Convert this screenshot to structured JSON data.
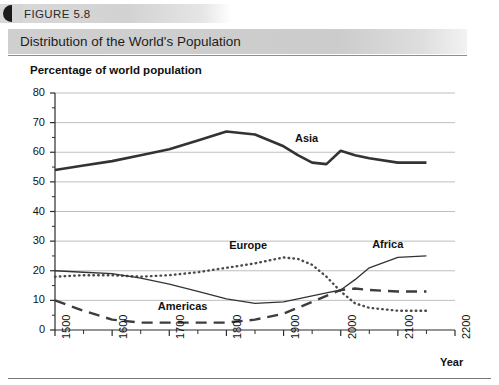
{
  "header": {
    "figure_number": "FIGURE 5.8",
    "badge_icon": "filled-circle-icon",
    "title": "Distribution of the World's Population"
  },
  "axis_title_label": "Year",
  "chart_data": {
    "type": "line",
    "title": "Distribution of the World's Population",
    "xlabel": "Year",
    "ylabel": "Percentage of world population",
    "y_axis_title_text": "Percentage of world population",
    "grid": true,
    "legend_position": "inline-annotations",
    "xlim": [
      1500,
      2200
    ],
    "ylim": [
      0,
      80
    ],
    "yticks": [
      0,
      10,
      20,
      30,
      40,
      50,
      60,
      70,
      80
    ],
    "ytick_labels": [
      "0",
      "10",
      "20",
      "30",
      "40",
      "50",
      "60",
      "70",
      "80"
    ],
    "xticks": [
      1500,
      1600,
      1700,
      1800,
      1900,
      2000,
      2100,
      2200
    ],
    "xtick_labels": [
      "1500",
      "1600",
      "1700",
      "1800",
      "1900",
      "2000",
      "2100",
      "2200"
    ],
    "x": [
      1500,
      1550,
      1600,
      1650,
      1700,
      1750,
      1800,
      1850,
      1900,
      1925,
      1950,
      1975,
      2000,
      2025,
      2050,
      2100,
      2150
    ],
    "series": [
      {
        "name": "Asia",
        "style": "solid-thick",
        "color": "#333333",
        "values": [
          54,
          55.5,
          57,
          59,
          61,
          64,
          67,
          66,
          62,
          59,
          56.5,
          56,
          60.5,
          59,
          58,
          56.5,
          56.5
        ]
      },
      {
        "name": "Europe",
        "style": "dotted",
        "color": "#4a4a4a",
        "values": [
          18,
          18.5,
          18.5,
          18,
          18.5,
          19.5,
          21,
          22.5,
          24.5,
          24,
          22,
          18,
          13,
          9,
          7.5,
          6.5,
          6.5
        ]
      },
      {
        "name": "Africa",
        "style": "solid-thin",
        "color": "#333333",
        "values": [
          20,
          19.5,
          19,
          17.5,
          15.5,
          13,
          10.5,
          9,
          9.5,
          10.5,
          11.5,
          12.5,
          13.5,
          17,
          21,
          24.5,
          25
        ]
      },
      {
        "name": "Americas",
        "style": "dashed",
        "color": "#3d3d3d",
        "values": [
          10,
          6.5,
          3.5,
          2.5,
          2.5,
          2.5,
          2.5,
          3.5,
          5.5,
          7.5,
          9.5,
          11.5,
          13.5,
          14,
          13.5,
          13,
          13
        ]
      }
    ],
    "annotations": [
      {
        "text": "Asia",
        "x": 1920,
        "y": 64
      },
      {
        "text": "Europe",
        "x": 1805,
        "y": 28
      },
      {
        "text": "Africa",
        "x": 2055,
        "y": 28.5
      },
      {
        "text": "Americas",
        "x": 1680,
        "y": 7.5
      }
    ]
  }
}
